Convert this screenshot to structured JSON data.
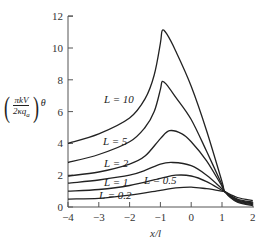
{
  "chart_data": {
    "type": "line",
    "title": "",
    "xlabel": "x/l",
    "ylabel": "(πkV / 2κq_a) θ",
    "xlim": [
      -4,
      2
    ],
    "ylim": [
      0,
      12
    ],
    "xticks": [
      "-4",
      "-3",
      "-2",
      "-1",
      "0",
      "1",
      "2"
    ],
    "yticks": [
      "0",
      "2",
      "4",
      "6",
      "8",
      "10",
      "12"
    ],
    "grid": false,
    "legend": "inline curve labels",
    "series": [
      {
        "name": "L=10",
        "label": "L = 10",
        "x": [
          -4,
          -3,
          -2,
          -1.5,
          -1.2,
          -1.0,
          -0.94,
          -0.8,
          -0.5,
          0,
          0.5,
          1.0,
          1.1,
          1.5,
          2.0
        ],
        "y": [
          4.0,
          4.6,
          5.6,
          6.8,
          8.3,
          10.3,
          11.1,
          10.9,
          9.8,
          7.6,
          4.8,
          1.6,
          0.95,
          0.3,
          0.1
        ]
      },
      {
        "name": "L=5",
        "label": "L = 5",
        "x": [
          -4,
          -3,
          -2,
          -1.5,
          -1.2,
          -1.0,
          -0.94,
          -0.8,
          -0.5,
          0,
          0.5,
          1.0,
          1.1,
          1.5,
          2.0
        ],
        "y": [
          2.8,
          3.3,
          4.1,
          5.0,
          6.0,
          7.4,
          7.9,
          7.7,
          6.9,
          5.5,
          3.5,
          1.4,
          0.95,
          0.35,
          0.15
        ]
      },
      {
        "name": "L=2",
        "label": "L = 2",
        "x": [
          -4,
          -3,
          -2,
          -1.5,
          -1.0,
          -0.7,
          -0.3,
          0,
          0.5,
          1.0,
          1.1,
          1.5,
          2.0
        ],
        "y": [
          1.95,
          2.2,
          2.7,
          3.2,
          4.3,
          4.8,
          4.6,
          4.1,
          2.9,
          1.3,
          0.95,
          0.4,
          0.2
        ]
      },
      {
        "name": "L=1",
        "label": "L = 1",
        "x": [
          -4,
          -3,
          -2,
          -1.5,
          -1.0,
          -0.6,
          0,
          0.5,
          1.0,
          1.1,
          1.5,
          2.0
        ],
        "y": [
          1.5,
          1.7,
          2.0,
          2.3,
          2.7,
          2.8,
          2.6,
          2.0,
          1.15,
          0.95,
          0.45,
          0.25
        ]
      },
      {
        "name": "L=0.5",
        "label": "L = 0.5",
        "x": [
          -4,
          -3,
          -2,
          -1.0,
          -0.5,
          0,
          0.5,
          1.0,
          1.1,
          1.5,
          2.0
        ],
        "y": [
          1.0,
          1.1,
          1.35,
          1.8,
          2.0,
          1.95,
          1.6,
          1.05,
          0.95,
          0.5,
          0.3
        ]
      },
      {
        "name": "L=0.2",
        "label": "L = 0.2",
        "x": [
          -4,
          -3,
          -2,
          -1.0,
          -0.5,
          0,
          0.5,
          1.0,
          1.1,
          1.5,
          2.0
        ],
        "y": [
          0.5,
          0.55,
          0.75,
          1.05,
          1.2,
          1.25,
          1.15,
          1.0,
          0.95,
          0.6,
          0.4
        ]
      }
    ]
  },
  "labels": {
    "ylabel_num": "πkV",
    "ylabel_den": "2κq",
    "ylabel_den_sub": "a",
    "ylabel_suffix": "θ",
    "xlabel": "x/l",
    "paren_open": "(",
    "paren_close": ")"
  }
}
